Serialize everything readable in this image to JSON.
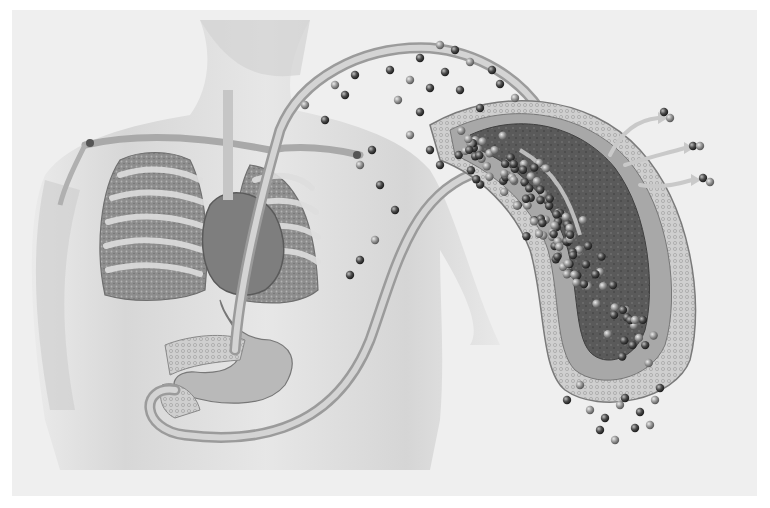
{
  "figure": {
    "style": "grayscale",
    "regions": [
      {
        "id": "torso",
        "name": "human torso"
      },
      {
        "id": "lungs",
        "name": "lungs"
      },
      {
        "id": "heart",
        "name": "heart"
      },
      {
        "id": "stomach",
        "name": "stomach"
      },
      {
        "id": "pancreas",
        "name": "pancreas"
      },
      {
        "id": "tube",
        "name": "looping tube"
      },
      {
        "id": "vessel-section",
        "name": "enlarged vessel cross-section"
      },
      {
        "id": "particles",
        "name": "particles"
      },
      {
        "id": "release-arrows",
        "name": "release arrows",
        "count": 3
      }
    ]
  },
  "colors": {
    "background": "#ffffff",
    "panel": "#efefef",
    "skin": "#d9d9d9",
    "organ": "#9a9a9a",
    "organ_dark": "#6e6e6e",
    "tube": "#bcbcbc",
    "particle_dark": "#3c3c3c",
    "particle_light": "#8a8a8a",
    "arrow": "#c8c8c8"
  }
}
